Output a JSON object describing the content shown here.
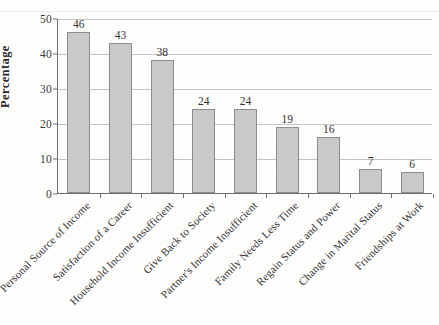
{
  "chart_data": {
    "type": "bar",
    "title": "",
    "xlabel": "",
    "ylabel": "Percentage",
    "ylim": [
      0,
      50
    ],
    "ytick_values": [
      0,
      10,
      20,
      30,
      40,
      50
    ],
    "ytick_labels": [
      "0",
      "10",
      "20",
      "30",
      "40",
      "50"
    ],
    "grid": true,
    "legend": "none",
    "label_rotation_deg": 45,
    "bar_fill_color": "#c9c9c9",
    "bar_edge_color": "#8d8d8d",
    "gridline_color": "#c4c4c4",
    "axis_color": "#6e6e6e",
    "background_color": "#fdfdfc",
    "categories": [
      "Personal Source of Income",
      "Satisfaction of a Career",
      "Household Income Insufficient",
      "Give Back to Society",
      "Partner's Income Insufficient",
      "Family Needs Less Time",
      "Regain Status and Power",
      "Change in Marital Status",
      "Friendships at Work"
    ],
    "values": [
      46,
      43,
      38,
      24,
      24,
      19,
      16,
      7,
      6
    ],
    "data_labels": [
      "46",
      "43",
      "38",
      "24",
      "24",
      "19",
      "16",
      "7",
      "6"
    ]
  }
}
